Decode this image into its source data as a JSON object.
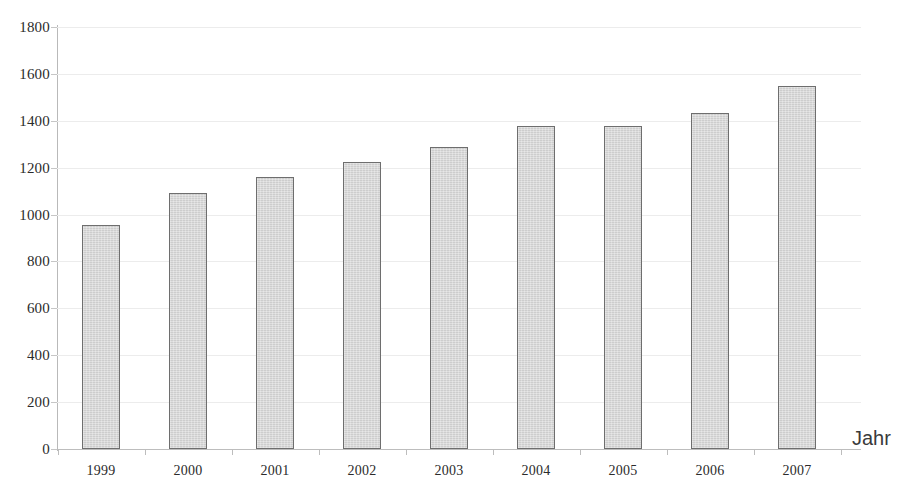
{
  "chart_data": {
    "type": "bar",
    "title": "",
    "subtitle": "",
    "xlabel": "Jahr",
    "ylabel": "",
    "categories": [
      "1999",
      "2000",
      "2001",
      "2002",
      "2003",
      "2004",
      "2005",
      "2006",
      "2007"
    ],
    "values": [
      955,
      1090,
      1160,
      1225,
      1290,
      1378,
      1378,
      1433,
      1548
    ],
    "ylim": [
      0,
      1800
    ],
    "ytick_labels": [
      "0",
      "200",
      "400",
      "600",
      "800",
      "1000",
      "1200",
      "1400",
      "1600",
      "1800"
    ],
    "ytick_values": [
      0,
      200,
      400,
      600,
      800,
      1000,
      1200,
      1400,
      1600,
      1800
    ],
    "ytick_step": 200,
    "grid": true,
    "grid_axis": "y",
    "legend": false,
    "legend_position": "none",
    "series": [
      {
        "name": "",
        "values": [
          955,
          1090,
          1160,
          1225,
          1290,
          1378,
          1378,
          1433,
          1548
        ]
      }
    ],
    "colors": {
      "bar_fill": "#d4d4d4",
      "bar_border": "#6e6e6e",
      "gridline": "#ececec",
      "axis_line": "#bdbdbd",
      "text": "#2b2b2b",
      "axis_title": "#3a3a3a",
      "background": "#ffffff"
    }
  }
}
